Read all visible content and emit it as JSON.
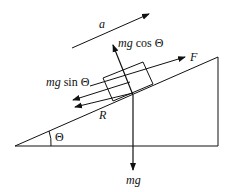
{
  "diagram": {
    "labels": {
      "acceleration": "a",
      "normal_component": "mg cos Θ",
      "normal_component_parts": [
        "mg",
        " cos Θ"
      ],
      "parallel_component": "mg sin Θ",
      "parallel_component_parts": [
        "mg",
        " sin Θ"
      ],
      "applied_force": "F",
      "resistance": "R",
      "weight": "mg",
      "angle": "Θ"
    },
    "colors": {
      "stroke": "#111111",
      "background": "#ffffff"
    }
  }
}
